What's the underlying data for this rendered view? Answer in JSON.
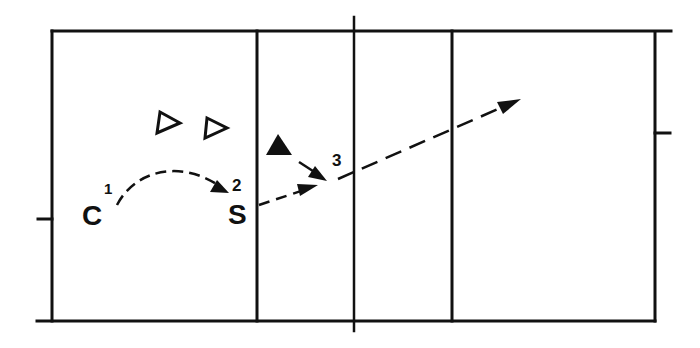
{
  "diagram": {
    "type": "volleyball-play",
    "line_color": "#111111",
    "background": "#ffffff",
    "court": {
      "outer": {
        "x": 52,
        "y": 31,
        "w": 603,
        "h": 290
      },
      "lines": [
        {
          "name": "attack-line-left",
          "x": 257
        },
        {
          "name": "center-net-line",
          "x": 354
        },
        {
          "name": "attack-line-right",
          "x": 452
        }
      ]
    },
    "players": [
      {
        "name": "player-open-1",
        "type": "open-triangle",
        "x": 170,
        "y": 124
      },
      {
        "name": "player-open-2",
        "type": "open-triangle",
        "x": 217,
        "y": 129
      },
      {
        "name": "player-attacker",
        "type": "filled-triangle",
        "x": 281,
        "y": 146
      }
    ],
    "labels": [
      {
        "name": "passer-label",
        "text": "C",
        "x": 96,
        "y": 225,
        "size": 28
      },
      {
        "name": "passer-step",
        "text": "1",
        "x": 108,
        "y": 192,
        "size": 15
      },
      {
        "name": "setter-label",
        "text": "S",
        "x": 237,
        "y": 224,
        "size": 28
      },
      {
        "name": "setter-step",
        "text": "2",
        "x": 237,
        "y": 191,
        "size": 17
      },
      {
        "name": "attack-step",
        "text": "3",
        "x": 313,
        "y": 166,
        "size": 17
      }
    ],
    "paths": [
      {
        "name": "pass-path",
        "from": "C",
        "to": "S",
        "style": "dashed-curve"
      },
      {
        "name": "set-path",
        "from": "S",
        "to": "3",
        "style": "dashed"
      },
      {
        "name": "approach-path",
        "from": "attacker",
        "to": "3",
        "style": "solid"
      },
      {
        "name": "attack-path",
        "from": "3",
        "to": "opponent-court",
        "style": "dashed"
      }
    ]
  }
}
